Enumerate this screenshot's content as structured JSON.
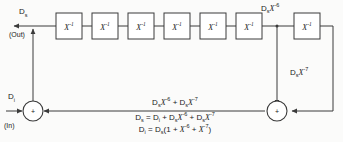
{
  "diagram": {
    "colors": {
      "background": "#fbfbfa",
      "line": "#3a3a3a",
      "box_fill": "#ffffff",
      "text": "#1a1a1a"
    },
    "stages": [
      {
        "id": "stage-1",
        "label": "X",
        "exponent": "-1"
      },
      {
        "id": "stage-2",
        "label": "X",
        "exponent": "-1"
      },
      {
        "id": "stage-3",
        "label": "X",
        "exponent": "-1"
      },
      {
        "id": "stage-4",
        "label": "X",
        "exponent": "-1"
      },
      {
        "id": "stage-5",
        "label": "X",
        "exponent": "-1"
      },
      {
        "id": "stage-6",
        "label": "X",
        "exponent": "-1"
      },
      {
        "id": "stage-7",
        "label": "X",
        "exponent": "-1"
      }
    ],
    "ports": {
      "output_symbol": "D",
      "output_subscript": "s",
      "output_direction": "(Out)",
      "input_symbol": "D",
      "input_subscript": "i",
      "input_direction": "(In)"
    },
    "taps": {
      "tap6_symbol": "D",
      "tap6_subscript": "s",
      "tap6_var": "X",
      "tap6_exponent": "-6",
      "tap7_symbol": "D",
      "tap7_subscript": "s",
      "tap7_var": "X",
      "tap7_exponent": "-7"
    },
    "adders": {
      "input_adder_sign": "+",
      "feedback_adder_sign": "+"
    },
    "equations": {
      "sum_line": {
        "t1_sym": "D",
        "t1_sub": "s",
        "t1_var": "X",
        "t1_exp": "-6",
        "op": "+",
        "t2_sym": "D",
        "t2_sub": "s",
        "t2_var": "X",
        "t2_exp": "-7"
      },
      "line2": {
        "lhs_sym": "D",
        "lhs_sub": "s",
        "eq": "=",
        "a_sym": "D",
        "a_sub": "i",
        "op1": "+",
        "b_sym": "D",
        "b_sub": "s",
        "b_var": "X",
        "b_exp": "-6",
        "op2": "+",
        "c_sym": "D",
        "c_sub": "s",
        "c_var": "X",
        "c_exp": "-7"
      },
      "line3": {
        "lhs_sym": "D",
        "lhs_sub": "i",
        "eq": "=",
        "r_sym": "D",
        "r_sub": "s",
        "open": "(",
        "one": "1",
        "op1": "+",
        "v1": "X",
        "e1": "-6",
        "op2": "+",
        "v2": "X",
        "e2": "-7",
        "close": ")"
      }
    }
  }
}
